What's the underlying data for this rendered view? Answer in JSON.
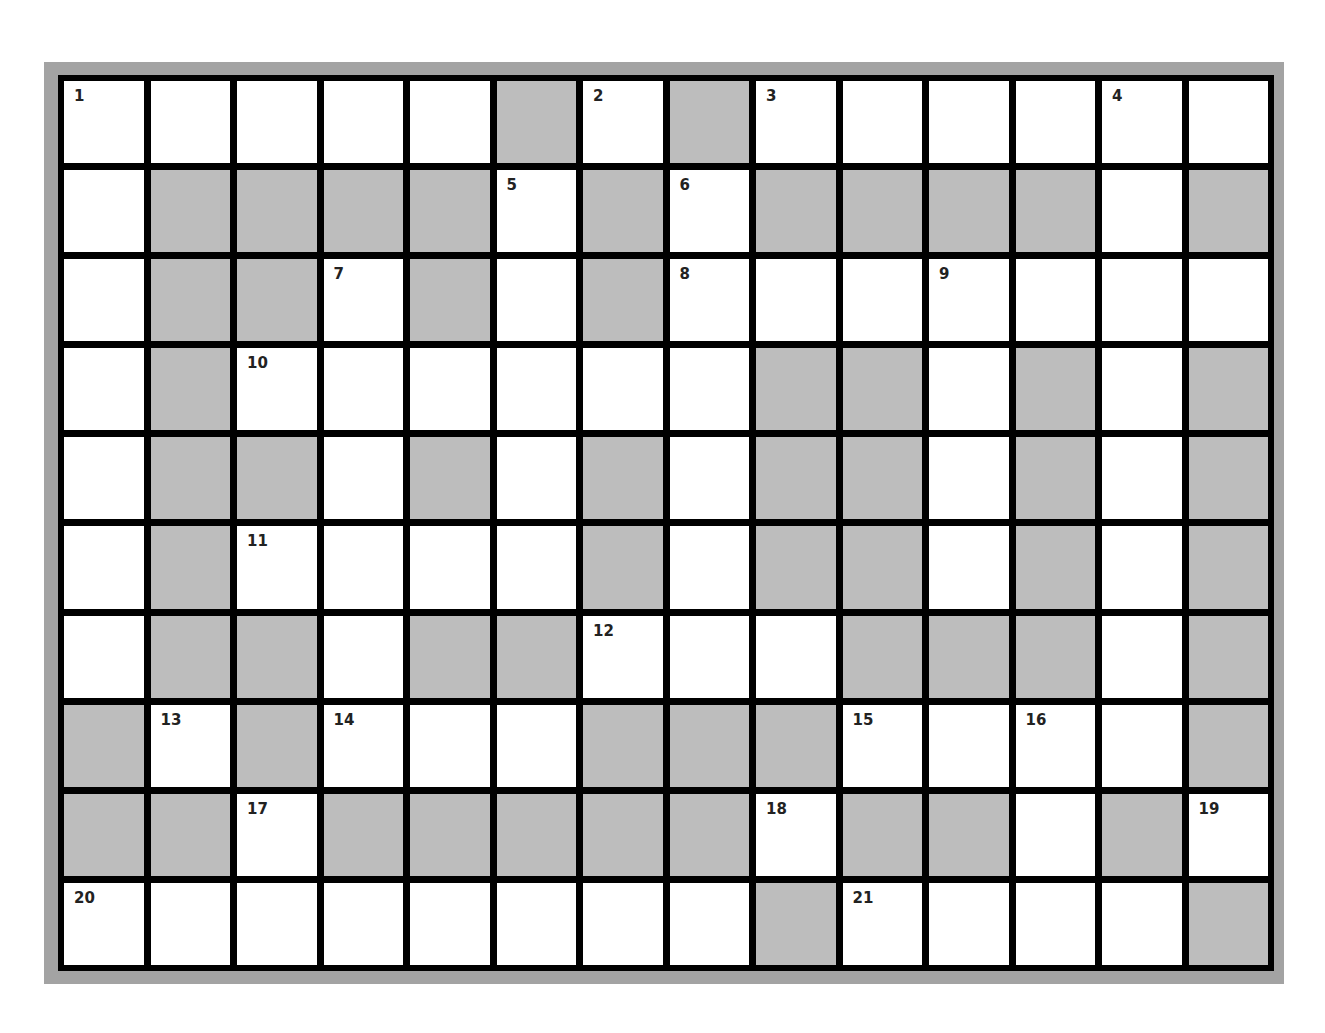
{
  "puzzle": {
    "rows": 10,
    "cols": 14,
    "colors": {
      "open": "#ffffff",
      "block": "#bdbdbd",
      "border": "#000000",
      "frame": "#a3a3a3"
    },
    "layout": [
      "OOOOOBOBOOOOOO",
      "OBBBBOBOBBBBOB",
      "OBBOBOBOOOOOOO",
      "OBOOOOOOBBOBOB",
      "OBBOBOBOBBOBOB",
      "OBOOOOBOBBOBOB",
      "OBBOBBOOOBBBOB",
      "BOBOOOBBBOOOOB",
      "BBOBBBBBOBBOBO",
      "OOOOOOOOBOOOOB"
    ],
    "numbers": [
      {
        "r": 0,
        "c": 0,
        "n": "1"
      },
      {
        "r": 0,
        "c": 6,
        "n": "2"
      },
      {
        "r": 0,
        "c": 8,
        "n": "3"
      },
      {
        "r": 0,
        "c": 12,
        "n": "4"
      },
      {
        "r": 1,
        "c": 5,
        "n": "5"
      },
      {
        "r": 1,
        "c": 7,
        "n": "6"
      },
      {
        "r": 2,
        "c": 3,
        "n": "7"
      },
      {
        "r": 2,
        "c": 7,
        "n": "8"
      },
      {
        "r": 2,
        "c": 10,
        "n": "9"
      },
      {
        "r": 3,
        "c": 2,
        "n": "10"
      },
      {
        "r": 5,
        "c": 2,
        "n": "11"
      },
      {
        "r": 6,
        "c": 6,
        "n": "12"
      },
      {
        "r": 7,
        "c": 1,
        "n": "13"
      },
      {
        "r": 7,
        "c": 3,
        "n": "14"
      },
      {
        "r": 7,
        "c": 9,
        "n": "15"
      },
      {
        "r": 7,
        "c": 11,
        "n": "16"
      },
      {
        "r": 8,
        "c": 2,
        "n": "17"
      },
      {
        "r": 8,
        "c": 8,
        "n": "18"
      },
      {
        "r": 8,
        "c": 13,
        "n": "19"
      },
      {
        "r": 9,
        "c": 0,
        "n": "20"
      },
      {
        "r": 9,
        "c": 9,
        "n": "21"
      }
    ]
  }
}
